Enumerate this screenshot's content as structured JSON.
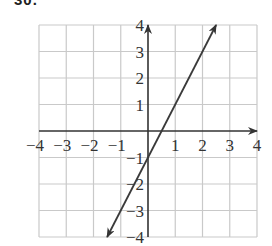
{
  "problem": {
    "number": "30."
  },
  "colors": {
    "grid": "#c9c9c9",
    "axis": "#333333",
    "line": "#3a3a3a",
    "text": "#333333"
  },
  "chart_data": {
    "type": "line",
    "title": "",
    "xlabel": "",
    "ylabel": "",
    "xlim": [
      -4,
      4
    ],
    "ylim": [
      -4,
      4
    ],
    "grid": true,
    "x_ticks": [
      "-4",
      "-3",
      "-2",
      "-1",
      "1",
      "2",
      "3",
      "4"
    ],
    "y_ticks": [
      "4",
      "3",
      "2",
      "1",
      "-1",
      "-2",
      "-3",
      "-4"
    ],
    "series": [
      {
        "name": "y = 2x - 1",
        "equation": "y = 2x - 1",
        "x": [
          -1.5,
          0,
          0.5,
          2.5
        ],
        "y": [
          -4,
          -1,
          0,
          4
        ],
        "arrows": "both"
      }
    ],
    "legend": null
  }
}
